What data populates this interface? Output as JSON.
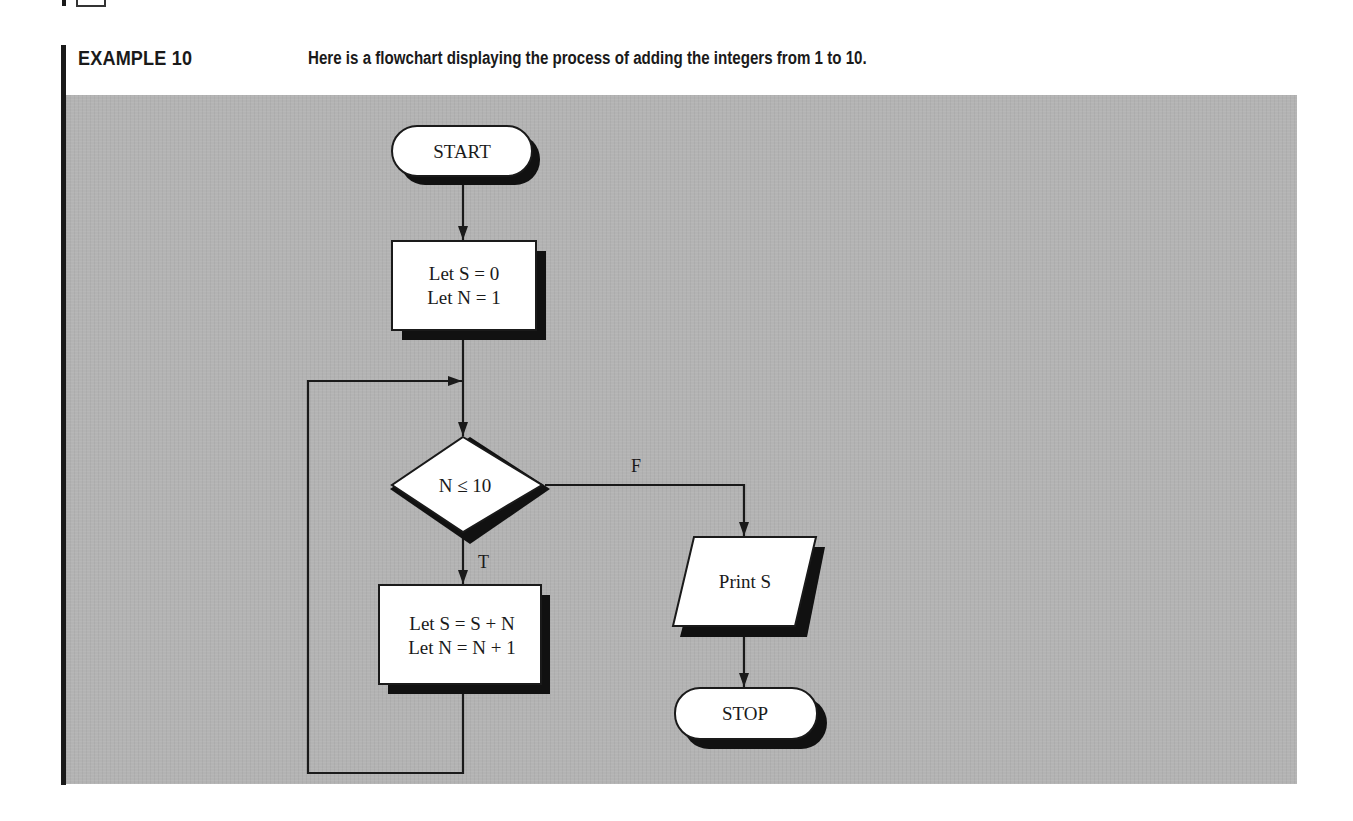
{
  "header": {
    "example_label": "EXAMPLE 10",
    "caption": "Here is a flowchart displaying the process of adding the integers from 1 to 10."
  },
  "flowchart": {
    "start": {
      "shape": "terminator",
      "label": "START"
    },
    "init": {
      "shape": "process",
      "lines": [
        "Let S = 0",
        "Let N = 1"
      ]
    },
    "decision": {
      "shape": "decision",
      "label": "N ≤ 10"
    },
    "loop_body": {
      "shape": "process",
      "lines": [
        "Let S = S + N",
        "Let N = N + 1"
      ]
    },
    "output": {
      "shape": "input-output",
      "label": "Print S"
    },
    "stop": {
      "shape": "terminator",
      "label": "STOP"
    },
    "edges": {
      "true_label": "T",
      "false_label": "F"
    }
  },
  "colors": {
    "panel": "#b3b3b3",
    "shape_fill": "#ffffff",
    "stroke": "#1a1a1a",
    "shadow": "#111111"
  }
}
